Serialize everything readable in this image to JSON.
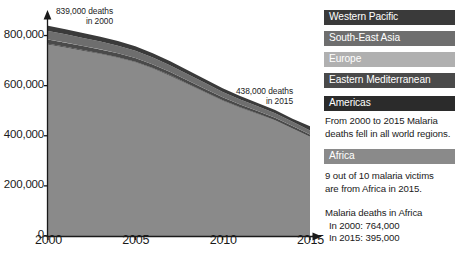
{
  "chart_data": {
    "type": "area",
    "title": "",
    "xlabel": "",
    "ylabel": "",
    "stacked": true,
    "grid": false,
    "legend_position": "right",
    "x": [
      2000,
      2001,
      2002,
      2003,
      2004,
      2005,
      2006,
      2007,
      2008,
      2009,
      2010,
      2011,
      2012,
      2013,
      2014,
      2015
    ],
    "xlim": [
      2000,
      2015
    ],
    "ylim": [
      0,
      870000
    ],
    "xticks": [
      "2000",
      "2005",
      "2010",
      "2015"
    ],
    "yticks": [
      "0",
      "200,000",
      "400,000",
      "600,000",
      "800,000"
    ],
    "ytick_values": [
      0,
      200000,
      400000,
      600000,
      800000
    ],
    "series": [
      {
        "name": "Africa",
        "color": "#8a8a8a",
        "values": [
          764000,
          752000,
          739000,
          726000,
          711000,
          693000,
          668000,
          639000,
          606000,
          573000,
          540000,
          512000,
          487000,
          461000,
          428000,
          395000
        ]
      },
      {
        "name": "Americas",
        "color": "#2b2b2b",
        "values": [
          3000,
          2900,
          2800,
          2700,
          2600,
          2500,
          2300,
          2200,
          2000,
          1900,
          1800,
          1600,
          1500,
          1400,
          1300,
          1200
        ]
      },
      {
        "name": "Eastern Mediterranean",
        "color": "#4a4a4a",
        "values": [
          17000,
          16600,
          16200,
          15800,
          15300,
          14900,
          14200,
          13500,
          12800,
          12100,
          11500,
          10900,
          10400,
          9900,
          9400,
          8800
        ]
      },
      {
        "name": "Europe",
        "color": "#b0b0b0",
        "values": [
          400,
          370,
          340,
          310,
          280,
          250,
          210,
          180,
          150,
          120,
          90,
          60,
          40,
          20,
          10,
          0
        ]
      },
      {
        "name": "South-East Asia",
        "color": "#6e6e6e",
        "values": [
          34000,
          33000,
          32000,
          31000,
          30000,
          29000,
          27500,
          26000,
          24500,
          23000,
          21500,
          20000,
          19000,
          18000,
          17000,
          16000
        ]
      },
      {
        "name": "Western Pacific",
        "color": "#3a3a3a",
        "values": [
          20600,
          20100,
          19600,
          19100,
          18600,
          18100,
          17300,
          16600,
          15800,
          15100,
          14300,
          13700,
          13100,
          12500,
          12000,
          17000
        ]
      }
    ],
    "totals": [
      839000,
      825000,
      810000,
      795000,
      778000,
      758000,
      729000,
      697000,
      661000,
      625000,
      589000,
      558000,
      531000,
      503000,
      468000,
      438000
    ],
    "annotations": [
      {
        "id": "start",
        "line1": "839,000 deaths",
        "line2": "in 2000",
        "x": 2000,
        "value": 839000
      },
      {
        "id": "end",
        "line1": "438,000 deaths",
        "line2": "in 2015",
        "x": 2015,
        "value": 438000
      }
    ]
  },
  "legend": {
    "items": [
      {
        "label": "Western Pacific",
        "color": "#3a3a3a",
        "text_color": "#ffffff"
      },
      {
        "label": "South-East Asia",
        "color": "#6e6e6e",
        "text_color": "#ffffff"
      },
      {
        "label": "Europe",
        "color": "#b0b0b0",
        "text_color": "#ffffff"
      },
      {
        "label": "Eastern Mediterranean",
        "color": "#4a4a4a",
        "text_color": "#ffffff"
      },
      {
        "label": "Americas",
        "color": "#2b2b2b",
        "text_color": "#ffffff"
      }
    ],
    "africa": {
      "label": "Africa",
      "color": "#8a8a8a",
      "text_color": "#ffffff"
    }
  },
  "notes": {
    "global_note_line1": "From 2000 to 2015 Malaria",
    "global_note_line2": "deaths fell in all world regions.",
    "africa_note_line1": "9 out of 10 malaria victims",
    "africa_note_line2": "are from Africa in 2015.",
    "africa_stat_title": "Malaria deaths in Africa",
    "africa_stat_2000": "In 2000: 764,000",
    "africa_stat_2015": "In 2015: 395,000"
  },
  "axis": {
    "ytick_0": "0",
    "ytick_200k": "200,000",
    "ytick_400k": "400,000",
    "ytick_600k": "600,000",
    "ytick_800k": "800,000",
    "xtick_2000": "2000",
    "xtick_2005": "2005",
    "xtick_2010": "2010",
    "xtick_2015": "2015"
  }
}
